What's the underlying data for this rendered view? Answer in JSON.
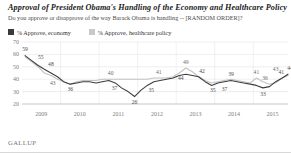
{
  "header": {
    "title": "Approval of President Obama's Handling of the Economy and Healthcare Policy",
    "subtitle": "Do you approve or disapprove of the way Barack Obama is handling -- [RANDOM ORDER]?"
  },
  "footer": {
    "source": "GALLUP"
  },
  "colors": {
    "economy": "#3d3d3d",
    "healthcare": "#c2c2c2",
    "grid": "#dddddd",
    "axis": "#b5b5b5",
    "text": "#2b2b2b"
  },
  "chart_data": {
    "type": "line",
    "title": "Approval of President Obama's Handling of the Economy and Healthcare Policy",
    "subtitle": "Do you approve or disapprove of the way Barack Obama is handling -- [RANDOM ORDER]?",
    "xlabel": "",
    "ylabel": "",
    "ylim": [
      20,
      70
    ],
    "yticks": [
      20,
      30,
      40,
      50,
      60,
      70
    ],
    "xticks": [
      "2009",
      "2010",
      "2011",
      "2012",
      "2013",
      "2014",
      "2015"
    ],
    "xlim": [
      2009.0,
      2015.9
    ],
    "grid": true,
    "legend_position": "top-left",
    "series": [
      {
        "name": "% Approve, economy",
        "color": "#3d3d3d",
        "x": [
          2009.08,
          2009.25,
          2009.42,
          2009.58,
          2009.75,
          2009.92,
          2010.08,
          2010.25,
          2010.42,
          2010.58,
          2010.75,
          2010.92,
          2011.08,
          2011.25,
          2011.42,
          2011.58,
          2011.75,
          2011.92,
          2012.08,
          2012.25,
          2012.42,
          2012.58,
          2012.75,
          2012.92,
          2013.08,
          2013.25,
          2013.42,
          2013.58,
          2013.75,
          2013.92,
          2014.08,
          2014.25,
          2014.42,
          2014.58,
          2014.75,
          2014.92,
          2015.08,
          2015.25,
          2015.42,
          2015.58,
          2015.75,
          2015.9
        ],
        "y": [
          59,
          55,
          51,
          48,
          45,
          42,
          38,
          36,
          37,
          38,
          38,
          37,
          38,
          39,
          37,
          33,
          30,
          26,
          31,
          35,
          38,
          39,
          40,
          41,
          43,
          44,
          43,
          42,
          38,
          35,
          37,
          38,
          39,
          38,
          37,
          36,
          35,
          33,
          34,
          38,
          41,
          44
        ]
      },
      {
        "name": "% Approve, healthcare policy",
        "color": "#c2c2c2",
        "x": [
          2009.08,
          2009.25,
          2009.42,
          2009.58,
          2009.75,
          2009.92,
          2010.08,
          2010.25,
          2010.42,
          2010.58,
          2010.75,
          2010.92,
          2011.08,
          2011.25,
          2011.42,
          2011.58,
          2011.75,
          2011.92,
          2012.08,
          2012.25,
          2012.42,
          2012.58,
          2012.75,
          2012.92,
          2013.08,
          2013.25,
          2013.42,
          2013.58,
          2013.75,
          2013.92,
          2014.08,
          2014.25,
          2014.42,
          2014.58,
          2014.75,
          2014.92,
          2015.08,
          2015.25,
          2015.42,
          2015.58,
          2015.75,
          2015.9
        ],
        "y": [
          58,
          54,
          50,
          45,
          43,
          40,
          38,
          36,
          38,
          39,
          39,
          39,
          40,
          40,
          40,
          40,
          40,
          40,
          40,
          40,
          41,
          41,
          41,
          42,
          45,
          49,
          46,
          42,
          39,
          37,
          38,
          39,
          40,
          39,
          38,
          37,
          41,
          38,
          36,
          37,
          41,
          43
        ]
      }
    ],
    "annotations": [
      {
        "label": "59",
        "x": 2009.08,
        "y": 59,
        "series": "economy",
        "dx": 0,
        "dy": -5
      },
      {
        "label": "55",
        "x": 2009.33,
        "y": 53,
        "series": "economy",
        "dx": 6,
        "dy": -4
      },
      {
        "label": "48",
        "x": 2009.62,
        "y": 48,
        "series": "economy",
        "dx": 5,
        "dy": -3
      },
      {
        "label": "43",
        "x": 2009.85,
        "y": 41,
        "series": "healthcare",
        "dx": -2,
        "dy": 7
      },
      {
        "label": "36",
        "x": 2010.25,
        "y": 36,
        "series": "economy",
        "dx": 0,
        "dy": 7
      },
      {
        "label": "40",
        "x": 2011.3,
        "y": 40,
        "series": "healthcare",
        "dx": 0,
        "dy": -4
      },
      {
        "label": "37",
        "x": 2011.45,
        "y": 37,
        "series": "economy",
        "dx": -2,
        "dy": 7
      },
      {
        "label": "26",
        "x": 2011.92,
        "y": 26,
        "series": "economy",
        "dx": 0,
        "dy": 7
      },
      {
        "label": "41",
        "x": 2012.55,
        "y": 41,
        "series": "healthcare",
        "dx": 0,
        "dy": -4
      },
      {
        "label": "35",
        "x": 2012.3,
        "y": 35,
        "series": "economy",
        "dx": 2,
        "dy": 7
      },
      {
        "label": "49",
        "x": 2013.25,
        "y": 49,
        "series": "healthcare",
        "dx": 0,
        "dy": -4
      },
      {
        "label": "44",
        "x": 2013.25,
        "y": 44,
        "series": "economy",
        "dx": -5,
        "dy": 6
      },
      {
        "label": "42",
        "x": 2013.62,
        "y": 42,
        "series": "economy",
        "dx": 2,
        "dy": -4
      },
      {
        "label": "35",
        "x": 2013.95,
        "y": 35,
        "series": "economy",
        "dx": 0,
        "dy": 7
      },
      {
        "label": "39",
        "x": 2014.42,
        "y": 39,
        "series": "economy",
        "dx": 0,
        "dy": -4
      },
      {
        "label": "37",
        "x": 2014.2,
        "y": 37,
        "series": "economy",
        "dx": 2,
        "dy": 8
      },
      {
        "label": "41",
        "x": 2015.08,
        "y": 41,
        "series": "healthcare",
        "dx": 0,
        "dy": -4
      },
      {
        "label": "36",
        "x": 2015.25,
        "y": 36,
        "series": "healthcare",
        "dx": 2,
        "dy": -4
      },
      {
        "label": "33",
        "x": 2015.25,
        "y": 33,
        "series": "economy",
        "dx": 0,
        "dy": 8
      },
      {
        "label": "43",
        "x": 2015.58,
        "y": 43,
        "series": "healthcare",
        "dx": 0,
        "dy": -4
      },
      {
        "label": "41",
        "x": 2015.75,
        "y": 41,
        "series": "economy",
        "dx": -1,
        "dy": -4
      },
      {
        "label": "44",
        "x": 2015.9,
        "y": 44,
        "series": "economy",
        "dx": 2,
        "dy": -4
      }
    ],
    "legend": [
      {
        "label": "% Approve, economy",
        "color": "#3d3d3d"
      },
      {
        "label": "% Approve, healthcare policy",
        "color": "#c2c2c2"
      }
    ]
  }
}
